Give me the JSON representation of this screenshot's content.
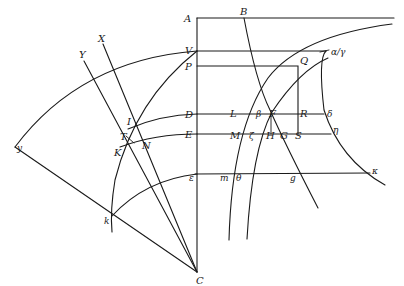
{
  "diagram": {
    "type": "geometric-construction",
    "background": "#ffffff",
    "stroke_color": "#1a1a1a",
    "labels": {
      "A": "A",
      "B": "B",
      "V": "V",
      "P": "P",
      "Q": "Q",
      "alpha_gamma": "α/γ",
      "D": "D",
      "L": "L",
      "beta": "β",
      "F": "F",
      "R": "R",
      "delta": "δ",
      "E": "E",
      "M": "M",
      "zeta": "ζ",
      "H": "H",
      "G": "G",
      "S": "S",
      "eta": "η",
      "epsilon": "ε",
      "m": "m",
      "theta": "θ",
      "g": "g",
      "kappa": "κ",
      "X": "X",
      "Y": "Y",
      "I": "I",
      "T": "T",
      "K": "K",
      "N": "N",
      "y": "y",
      "k": "k",
      "C": "C"
    },
    "points": {
      "A": [
        197,
        18
      ],
      "V": [
        197,
        51
      ],
      "P": [
        197,
        66
      ],
      "D": [
        197,
        114
      ],
      "E": [
        197,
        134
      ],
      "epsilon": [
        197,
        175
      ],
      "C": [
        197,
        272
      ],
      "B": [
        244,
        18
      ],
      "Q": [
        298,
        66
      ],
      "R": [
        298,
        114
      ],
      "S": [
        298,
        134
      ],
      "alpha_gamma": [
        327,
        51
      ],
      "y": [
        15,
        147
      ],
      "k": [
        112,
        216
      ],
      "X": [
        103,
        44
      ],
      "Y": [
        84,
        61
      ],
      "I": [
        128,
        129
      ],
      "T": [
        124,
        139
      ],
      "K": [
        120,
        147
      ],
      "N": [
        135,
        142
      ]
    }
  }
}
